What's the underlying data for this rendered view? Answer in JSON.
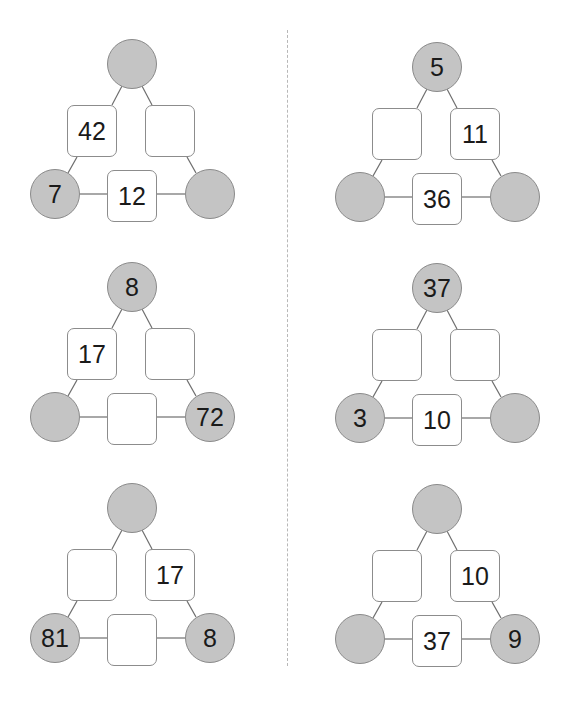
{
  "worksheet": {
    "colors": {
      "circle_fill": "#c4c4c4",
      "circle_border": "#8a8a8a",
      "box_border": "#8c8c8c",
      "line": "#6e6e6e",
      "divider": "#b8b8b8"
    },
    "puzzles": [
      {
        "id": "p1",
        "top": "",
        "left": "7",
        "right": "",
        "box_left": "42",
        "box_right": "",
        "box_bottom": "12"
      },
      {
        "id": "p2",
        "top": "5",
        "left": "",
        "right": "",
        "box_left": "",
        "box_right": "11",
        "box_bottom": "36"
      },
      {
        "id": "p3",
        "top": "8",
        "left": "",
        "right": "72",
        "box_left": "17",
        "box_right": "",
        "box_bottom": ""
      },
      {
        "id": "p4",
        "top": "37",
        "left": "3",
        "right": "",
        "box_left": "",
        "box_right": "",
        "box_bottom": "10"
      },
      {
        "id": "p5",
        "top": "",
        "left": "81",
        "right": "8",
        "box_left": "",
        "box_right": "17",
        "box_bottom": ""
      },
      {
        "id": "p6",
        "top": "",
        "left": "",
        "right": "9",
        "box_left": "",
        "box_right": "10",
        "box_bottom": "37"
      }
    ]
  }
}
